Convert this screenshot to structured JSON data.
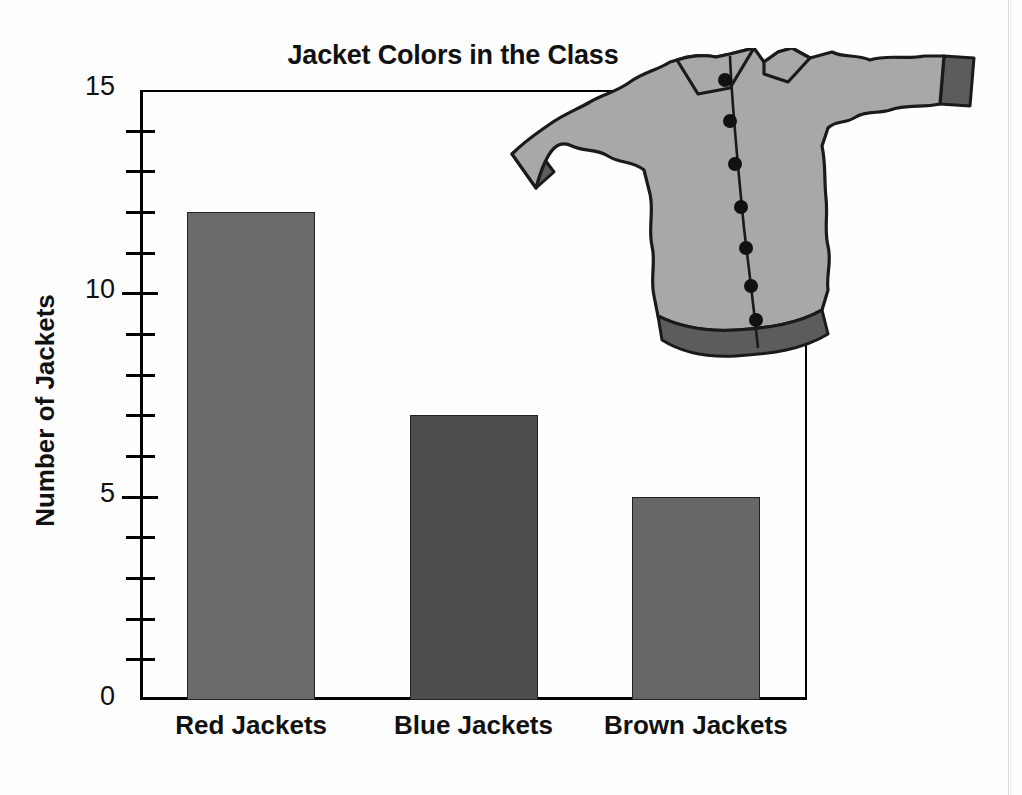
{
  "figure": {
    "background_color": "#fefefe",
    "axis_color": "#000000"
  },
  "chart_data": {
    "type": "bar",
    "title": "Jacket Colors in the Class",
    "xlabel": "",
    "ylabel": "Number of Jackets",
    "categories": [
      "Red Jackets",
      "Blue Jackets",
      "Brown Jackets"
    ],
    "values": [
      12,
      7,
      5
    ],
    "ylim": [
      0,
      15
    ],
    "y_major_ticks": [
      0,
      5,
      10,
      15
    ],
    "y_major_tick_labels": [
      "0",
      "5",
      "10",
      "15"
    ],
    "y_minor_ticks": [
      1,
      2,
      3,
      4,
      6,
      7,
      8,
      9,
      11,
      12,
      13,
      14
    ],
    "grid": false,
    "legend": null,
    "bar_colors": [
      "#6a6a6a",
      "#4d4d4d",
      "#666666"
    ],
    "bar_edge_color": "#222222"
  },
  "illustration": {
    "name": "jacket-illustration",
    "description": "Gray buttoned jacket with dark cuffs and hem band",
    "body_color": "#a8a8a8",
    "trim_color": "#5c5c5c",
    "outline_color": "#1a1a1a",
    "button_color": "#111111",
    "button_count": 7
  }
}
